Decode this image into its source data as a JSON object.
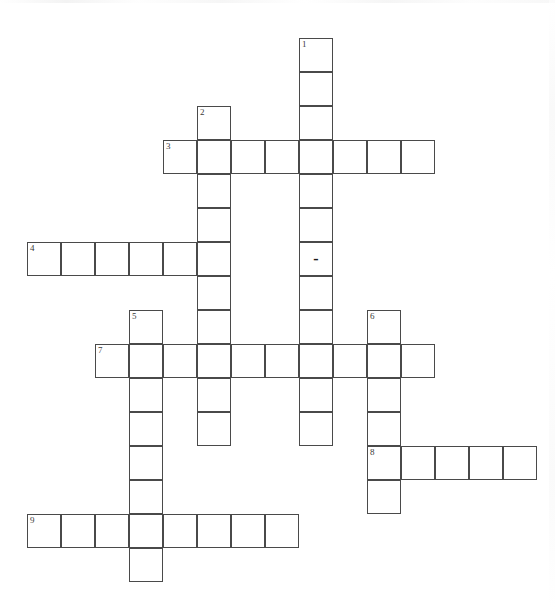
{
  "document": {
    "kind": "crossword-puzzle",
    "title": "",
    "background_color": "#ffffff",
    "grid_line_color": "#4a4a4a",
    "cell_size_px": 34,
    "origin_x_px": 27,
    "origin_y_px": 38
  },
  "clue_numbers": [
    "1",
    "2",
    "3",
    "4",
    "5",
    "6",
    "7",
    "8",
    "9"
  ],
  "entries": [
    {
      "number": "1",
      "direction": "down",
      "length": 12,
      "start_col": 8,
      "start_row": 0
    },
    {
      "number": "2",
      "direction": "down",
      "length": 10,
      "start_col": 5,
      "start_row": 2
    },
    {
      "number": "3",
      "direction": "across",
      "length": 8,
      "start_col": 4,
      "start_row": 3
    },
    {
      "number": "4",
      "direction": "across",
      "length": 6,
      "start_col": 0,
      "start_row": 6
    },
    {
      "number": "5",
      "direction": "down",
      "length": 8,
      "start_col": 3,
      "start_row": 8
    },
    {
      "number": "6",
      "direction": "down",
      "length": 6,
      "start_col": 10,
      "start_row": 8
    },
    {
      "number": "7",
      "direction": "across",
      "length": 10,
      "start_col": 2,
      "start_row": 9
    },
    {
      "number": "8",
      "direction": "across",
      "length": 5,
      "start_col": 10,
      "start_row": 12
    },
    {
      "number": "9",
      "direction": "across",
      "length": 8,
      "start_col": 0,
      "start_row": 14
    }
  ],
  "cells": [
    {
      "id": "c-8-0",
      "col": 8,
      "row": 0,
      "number": "1",
      "letter": ""
    },
    {
      "id": "c-8-1",
      "col": 8,
      "row": 1,
      "number": "",
      "letter": ""
    },
    {
      "id": "c-8-2",
      "col": 8,
      "row": 2,
      "number": "",
      "letter": ""
    },
    {
      "id": "c-8-3",
      "col": 8,
      "row": 3,
      "number": "",
      "letter": ""
    },
    {
      "id": "c-8-4",
      "col": 8,
      "row": 4,
      "number": "",
      "letter": ""
    },
    {
      "id": "c-8-5",
      "col": 8,
      "row": 5,
      "number": "",
      "letter": ""
    },
    {
      "id": "c-8-6",
      "col": 8,
      "row": 6,
      "number": "",
      "letter": "-"
    },
    {
      "id": "c-8-7",
      "col": 8,
      "row": 7,
      "number": "",
      "letter": ""
    },
    {
      "id": "c-8-8",
      "col": 8,
      "row": 8,
      "number": "",
      "letter": ""
    },
    {
      "id": "c-8-9",
      "col": 8,
      "row": 9,
      "number": "",
      "letter": ""
    },
    {
      "id": "c-8-10",
      "col": 8,
      "row": 10,
      "number": "",
      "letter": ""
    },
    {
      "id": "c-8-11",
      "col": 8,
      "row": 11,
      "number": "",
      "letter": ""
    },
    {
      "id": "c-5-2",
      "col": 5,
      "row": 2,
      "number": "2",
      "letter": ""
    },
    {
      "id": "c-5-3",
      "col": 5,
      "row": 3,
      "number": "",
      "letter": ""
    },
    {
      "id": "c-5-4",
      "col": 5,
      "row": 4,
      "number": "",
      "letter": ""
    },
    {
      "id": "c-5-5",
      "col": 5,
      "row": 5,
      "number": "",
      "letter": ""
    },
    {
      "id": "c-5-6",
      "col": 5,
      "row": 6,
      "number": "",
      "letter": ""
    },
    {
      "id": "c-5-7",
      "col": 5,
      "row": 7,
      "number": "",
      "letter": ""
    },
    {
      "id": "c-5-8",
      "col": 5,
      "row": 8,
      "number": "",
      "letter": ""
    },
    {
      "id": "c-5-9",
      "col": 5,
      "row": 9,
      "number": "",
      "letter": ""
    },
    {
      "id": "c-5-10",
      "col": 5,
      "row": 10,
      "number": "",
      "letter": ""
    },
    {
      "id": "c-5-11",
      "col": 5,
      "row": 11,
      "number": "",
      "letter": ""
    },
    {
      "id": "c-4-3",
      "col": 4,
      "row": 3,
      "number": "3",
      "letter": ""
    },
    {
      "id": "c-6-3",
      "col": 6,
      "row": 3,
      "number": "",
      "letter": ""
    },
    {
      "id": "c-7-3",
      "col": 7,
      "row": 3,
      "number": "",
      "letter": ""
    },
    {
      "id": "c-9-3",
      "col": 9,
      "row": 3,
      "number": "",
      "letter": ""
    },
    {
      "id": "c-10-3",
      "col": 10,
      "row": 3,
      "number": "",
      "letter": ""
    },
    {
      "id": "c-11-3",
      "col": 11,
      "row": 3,
      "number": "",
      "letter": ""
    },
    {
      "id": "c-0-6",
      "col": 0,
      "row": 6,
      "number": "4",
      "letter": ""
    },
    {
      "id": "c-1-6",
      "col": 1,
      "row": 6,
      "number": "",
      "letter": ""
    },
    {
      "id": "c-2-6",
      "col": 2,
      "row": 6,
      "number": "",
      "letter": ""
    },
    {
      "id": "c-3-6",
      "col": 3,
      "row": 6,
      "number": "",
      "letter": ""
    },
    {
      "id": "c-4-6",
      "col": 4,
      "row": 6,
      "number": "",
      "letter": ""
    },
    {
      "id": "c-3-8",
      "col": 3,
      "row": 8,
      "number": "5",
      "letter": ""
    },
    {
      "id": "c-3-9",
      "col": 3,
      "row": 9,
      "number": "",
      "letter": ""
    },
    {
      "id": "c-3-10",
      "col": 3,
      "row": 10,
      "number": "",
      "letter": ""
    },
    {
      "id": "c-3-11",
      "col": 3,
      "row": 11,
      "number": "",
      "letter": ""
    },
    {
      "id": "c-3-12",
      "col": 3,
      "row": 12,
      "number": "",
      "letter": ""
    },
    {
      "id": "c-3-13",
      "col": 3,
      "row": 13,
      "number": "",
      "letter": ""
    },
    {
      "id": "c-3-14",
      "col": 3,
      "row": 14,
      "number": "",
      "letter": ""
    },
    {
      "id": "c-3-15",
      "col": 3,
      "row": 15,
      "number": "",
      "letter": ""
    },
    {
      "id": "c-10-8",
      "col": 10,
      "row": 8,
      "number": "6",
      "letter": ""
    },
    {
      "id": "c-10-9",
      "col": 10,
      "row": 9,
      "number": "",
      "letter": ""
    },
    {
      "id": "c-10-10",
      "col": 10,
      "row": 10,
      "number": "",
      "letter": ""
    },
    {
      "id": "c-10-11",
      "col": 10,
      "row": 11,
      "number": "",
      "letter": ""
    },
    {
      "id": "c-10-12",
      "col": 10,
      "row": 12,
      "number": "8",
      "letter": ""
    },
    {
      "id": "c-10-13",
      "col": 10,
      "row": 13,
      "number": "",
      "letter": ""
    },
    {
      "id": "c-2-9",
      "col": 2,
      "row": 9,
      "number": "7",
      "letter": ""
    },
    {
      "id": "c-4-9",
      "col": 4,
      "row": 9,
      "number": "",
      "letter": ""
    },
    {
      "id": "c-6-9",
      "col": 6,
      "row": 9,
      "number": "",
      "letter": ""
    },
    {
      "id": "c-7-9",
      "col": 7,
      "row": 9,
      "number": "",
      "letter": ""
    },
    {
      "id": "c-9-9",
      "col": 9,
      "row": 9,
      "number": "",
      "letter": ""
    },
    {
      "id": "c-11-9",
      "col": 11,
      "row": 9,
      "number": "",
      "letter": ""
    },
    {
      "id": "c-11-12",
      "col": 11,
      "row": 12,
      "number": "",
      "letter": ""
    },
    {
      "id": "c-12-12",
      "col": 12,
      "row": 12,
      "number": "",
      "letter": ""
    },
    {
      "id": "c-13-12",
      "col": 13,
      "row": 12,
      "number": "",
      "letter": ""
    },
    {
      "id": "c-14-12",
      "col": 14,
      "row": 12,
      "number": "",
      "letter": ""
    },
    {
      "id": "c-0-14",
      "col": 0,
      "row": 14,
      "number": "9",
      "letter": ""
    },
    {
      "id": "c-1-14",
      "col": 1,
      "row": 14,
      "number": "",
      "letter": ""
    },
    {
      "id": "c-2-14",
      "col": 2,
      "row": 14,
      "number": "",
      "letter": ""
    },
    {
      "id": "c-4-14",
      "col": 4,
      "row": 14,
      "number": "",
      "letter": ""
    },
    {
      "id": "c-5-14",
      "col": 5,
      "row": 14,
      "number": "",
      "letter": ""
    },
    {
      "id": "c-6-14",
      "col": 6,
      "row": 14,
      "number": "",
      "letter": ""
    },
    {
      "id": "c-7-14",
      "col": 7,
      "row": 14,
      "number": "",
      "letter": ""
    }
  ]
}
